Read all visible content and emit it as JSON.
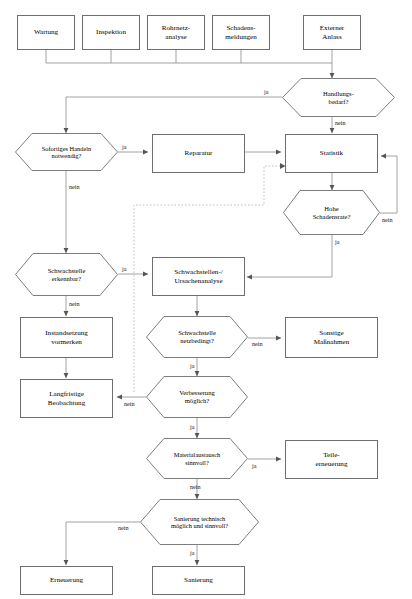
{
  "diagram": {
    "language": "de",
    "colors": {
      "stroke": "#6e6e6e",
      "line": "#8a8a8a",
      "dashed": "#b9b9b9",
      "text": "#000000",
      "background": "#ffffff"
    },
    "nodes": [
      {
        "id": "wartung",
        "type": "process",
        "label": "Wartung"
      },
      {
        "id": "inspektion",
        "type": "process",
        "label": "Inspektion"
      },
      {
        "id": "rohrnetz",
        "type": "process",
        "label": "Rohrnetz-\nanalyse",
        "line1": "Rohrnetz-",
        "line2": "analyse"
      },
      {
        "id": "schadens",
        "type": "process",
        "label": "Schadens-\nmeldungen",
        "line1": "Schadens-",
        "line2": "meldungen"
      },
      {
        "id": "externer",
        "type": "process",
        "label": "Externer\nAnlass",
        "line1": "Externer",
        "line2": "Anlass"
      },
      {
        "id": "handlungsbedarf",
        "type": "decision",
        "label": "Handlungs-\nbedarf?",
        "line1": "Handlungs-",
        "line2": "bedarf?"
      },
      {
        "id": "sofortiges",
        "type": "decision",
        "label": "Sofortiges Handeln\nnotwendig?",
        "line1": "Sofortiges Handeln",
        "line2": "notwendig?"
      },
      {
        "id": "reparatur",
        "type": "process",
        "label": "Reparatur"
      },
      {
        "id": "statistik",
        "type": "process",
        "label": "Statistik"
      },
      {
        "id": "hohe",
        "type": "decision",
        "label": "Hohe\nSchadensrate?",
        "line1": "Hohe",
        "line2": "Schadensrate?"
      },
      {
        "id": "schwachstelle_erk",
        "type": "decision",
        "label": "Schwachstelle\nerkennbar?",
        "line1": "Schwachstelle",
        "line2": "erkennbar?"
      },
      {
        "id": "ursachenanalyse",
        "type": "process",
        "label": "Schwachstellen-/\nUrsachenanalyse",
        "line1": "Schwachstellen-/",
        "line2": "Ursachenanalyse"
      },
      {
        "id": "instandsetzung",
        "type": "process",
        "label": "Instandsetzung\nvormerken",
        "line1": "Instandsetzung",
        "line2": "vormerken"
      },
      {
        "id": "netzbedingt",
        "type": "decision",
        "label": "Schwachstelle\nnetzbedingt?",
        "line1": "Schwachstelle",
        "line2": "netzbedingt?"
      },
      {
        "id": "sonstige",
        "type": "process",
        "label": "Sonstige\nMaßnahmen",
        "line1": "Sonstige",
        "line2": "Maßnahmen"
      },
      {
        "id": "langfristige",
        "type": "process",
        "label": "Langfristige\nBeobachtung",
        "line1": "Langfristige",
        "line2": "Beobachtung"
      },
      {
        "id": "verbesserung",
        "type": "decision",
        "label": "Verbesserung\nmöglich?",
        "line1": "Verbesserung",
        "line2": "möglich?"
      },
      {
        "id": "material",
        "type": "decision",
        "label": "Materialaustausch\nsinnvoll?",
        "line1": "Materialaustausch",
        "line2": "sinnvoll?"
      },
      {
        "id": "teile",
        "type": "process",
        "label": "Teile-\nerneuerung",
        "line1": "Teile-",
        "line2": "erneuerung"
      },
      {
        "id": "sanierung_q",
        "type": "decision",
        "label": "Sanierung technisch\nmöglich und sinnvoll?",
        "line1": "Sanierung technisch",
        "line2": "möglich und sinnvoll?"
      },
      {
        "id": "erneuerung",
        "type": "process",
        "label": "Erneuerung"
      },
      {
        "id": "sanierung",
        "type": "process",
        "label": "Sanierung"
      }
    ],
    "edge_labels": {
      "handlungsbedarf_ja": "ja",
      "handlungsbedarf_nein": "nein",
      "sofortiges_ja": "ja",
      "sofortiges_nein": "nein",
      "hohe_ja": "ja",
      "hohe_nein": "nein",
      "schwachstelle_ja": "ja",
      "schwachstelle_nein": "nein",
      "netzbedingt_ja": "ja",
      "netzbedingt_nein": "nein",
      "verbesserung_ja": "ja",
      "verbesserung_nein": "nein",
      "material_ja": "ja",
      "material_nein": "nein",
      "sanierung_ja": "ja",
      "sanierung_nein": "nein"
    }
  }
}
